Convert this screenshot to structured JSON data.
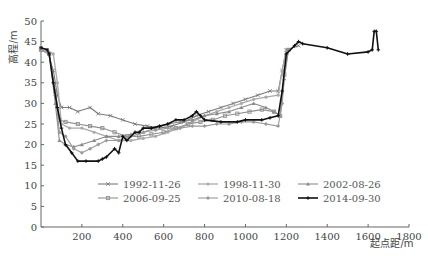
{
  "chart_data": {
    "type": "line",
    "title": "",
    "xlabel": "起点距/m",
    "ylabel": "高程/m",
    "xlim": [
      0,
      1800
    ],
    "ylim": [
      0,
      50
    ],
    "xticks": [
      200,
      400,
      600,
      800,
      1000,
      1200,
      1400,
      1600,
      1800
    ],
    "yticks": [
      0,
      5,
      10,
      15,
      20,
      25,
      30,
      35,
      40,
      45,
      50
    ],
    "grid": false,
    "legend_position": "lower center (inside plot)",
    "series": [
      {
        "name": "1992-11-26",
        "marker": "x",
        "color": "#7a7a7a",
        "width": 1.1,
        "points": [
          [
            0,
            43.5
          ],
          [
            30,
            43
          ],
          [
            60,
            38
          ],
          [
            80,
            32
          ],
          [
            100,
            29
          ],
          [
            140,
            29
          ],
          [
            180,
            28
          ],
          [
            240,
            29
          ],
          [
            280,
            27.5
          ],
          [
            340,
            27
          ],
          [
            400,
            26
          ],
          [
            460,
            25
          ],
          [
            520,
            24.5
          ],
          [
            580,
            24
          ],
          [
            640,
            24.5
          ],
          [
            700,
            25.5
          ],
          [
            760,
            27
          ],
          [
            820,
            28
          ],
          [
            880,
            29
          ],
          [
            940,
            30
          ],
          [
            1000,
            31
          ],
          [
            1060,
            32
          ],
          [
            1120,
            33
          ],
          [
            1160,
            33
          ],
          [
            1180,
            38
          ],
          [
            1200,
            43
          ],
          [
            1260,
            44
          ]
        ]
      },
      {
        "name": "1998-11-30",
        "marker": "circle",
        "color": "#aaaaaa",
        "width": 1.3,
        "points": [
          [
            0,
            43
          ],
          [
            30,
            43
          ],
          [
            60,
            42
          ],
          [
            80,
            35
          ],
          [
            100,
            25
          ],
          [
            140,
            24
          ],
          [
            200,
            24
          ],
          [
            260,
            23
          ],
          [
            320,
            22
          ],
          [
            380,
            21
          ],
          [
            440,
            21
          ],
          [
            500,
            21.5
          ],
          [
            560,
            22
          ],
          [
            620,
            23
          ],
          [
            680,
            24
          ],
          [
            740,
            25.5
          ],
          [
            800,
            27
          ],
          [
            860,
            28
          ],
          [
            920,
            29
          ],
          [
            980,
            30
          ],
          [
            1040,
            31
          ],
          [
            1100,
            31.5
          ],
          [
            1160,
            32
          ],
          [
            1180,
            38
          ],
          [
            1200,
            43
          ]
        ]
      },
      {
        "name": "2002-08-26",
        "marker": "triangle",
        "color": "#8a8a8a",
        "width": 1.1,
        "points": [
          [
            0,
            43
          ],
          [
            40,
            42
          ],
          [
            70,
            30
          ],
          [
            90,
            21
          ],
          [
            120,
            20
          ],
          [
            160,
            19.5
          ],
          [
            200,
            20
          ],
          [
            260,
            21
          ],
          [
            320,
            22
          ],
          [
            380,
            22
          ],
          [
            440,
            22.5
          ],
          [
            500,
            23
          ],
          [
            560,
            24
          ],
          [
            620,
            25
          ],
          [
            680,
            25.5
          ],
          [
            740,
            26
          ],
          [
            800,
            27
          ],
          [
            860,
            27.5
          ],
          [
            920,
            28
          ],
          [
            980,
            29
          ],
          [
            1040,
            30
          ],
          [
            1100,
            29
          ],
          [
            1140,
            28
          ],
          [
            1170,
            27
          ],
          [
            1190,
            36
          ],
          [
            1210,
            43
          ]
        ]
      },
      {
        "name": "2006-09-25",
        "marker": "square",
        "color": "#909090",
        "width": 1.1,
        "points": [
          [
            0,
            43
          ],
          [
            40,
            42
          ],
          [
            70,
            33
          ],
          [
            90,
            26
          ],
          [
            120,
            25.5
          ],
          [
            180,
            25
          ],
          [
            240,
            24.5
          ],
          [
            300,
            24
          ],
          [
            360,
            23
          ],
          [
            420,
            22
          ],
          [
            480,
            22
          ],
          [
            540,
            22.5
          ],
          [
            600,
            23
          ],
          [
            660,
            24
          ],
          [
            720,
            25
          ],
          [
            780,
            25.5
          ],
          [
            840,
            26
          ],
          [
            900,
            27
          ],
          [
            960,
            27.5
          ],
          [
            1020,
            28
          ],
          [
            1080,
            28.5
          ],
          [
            1140,
            28
          ],
          [
            1170,
            27
          ],
          [
            1190,
            37
          ],
          [
            1210,
            43
          ]
        ]
      },
      {
        "name": "2010-08-18",
        "marker": "diamond",
        "color": "#9a9a9a",
        "width": 1.1,
        "points": [
          [
            0,
            43
          ],
          [
            40,
            42
          ],
          [
            70,
            32
          ],
          [
            90,
            23
          ],
          [
            120,
            22
          ],
          [
            160,
            19
          ],
          [
            200,
            18
          ],
          [
            240,
            19
          ],
          [
            280,
            20
          ],
          [
            320,
            21
          ],
          [
            380,
            21
          ],
          [
            440,
            22
          ],
          [
            500,
            23
          ],
          [
            560,
            23.5
          ],
          [
            620,
            24
          ],
          [
            680,
            24
          ],
          [
            740,
            24.5
          ],
          [
            800,
            24.5
          ],
          [
            860,
            25
          ],
          [
            920,
            25
          ],
          [
            980,
            25.5
          ],
          [
            1040,
            25.5
          ],
          [
            1100,
            25
          ],
          [
            1160,
            24.5
          ],
          [
            1180,
            30
          ],
          [
            1200,
            42
          ]
        ]
      },
      {
        "name": "2014-09-30",
        "marker": "plus",
        "color": "#111111",
        "width": 1.6,
        "points": [
          [
            0,
            43.5
          ],
          [
            30,
            43
          ],
          [
            40,
            42
          ],
          [
            60,
            35
          ],
          [
            80,
            29
          ],
          [
            100,
            24
          ],
          [
            120,
            20
          ],
          [
            150,
            18
          ],
          [
            180,
            16
          ],
          [
            220,
            16
          ],
          [
            280,
            16
          ],
          [
            300,
            16.5
          ],
          [
            320,
            17
          ],
          [
            360,
            19
          ],
          [
            380,
            18
          ],
          [
            400,
            22
          ],
          [
            420,
            21
          ],
          [
            460,
            23
          ],
          [
            480,
            23
          ],
          [
            500,
            24
          ],
          [
            540,
            24
          ],
          [
            580,
            24.5
          ],
          [
            620,
            25
          ],
          [
            660,
            26
          ],
          [
            700,
            26
          ],
          [
            740,
            27
          ],
          [
            760,
            28
          ],
          [
            780,
            27
          ],
          [
            800,
            26
          ],
          [
            880,
            25.5
          ],
          [
            960,
            25.5
          ],
          [
            1000,
            26
          ],
          [
            1080,
            26
          ],
          [
            1120,
            26.5
          ],
          [
            1160,
            27
          ],
          [
            1180,
            33
          ],
          [
            1200,
            42
          ],
          [
            1240,
            44
          ],
          [
            1260,
            45
          ],
          [
            1280,
            44.5
          ],
          [
            1400,
            43.5
          ],
          [
            1500,
            42
          ],
          [
            1600,
            42.5
          ],
          [
            1620,
            43
          ],
          [
            1630,
            47.5
          ],
          [
            1640,
            47.5
          ],
          [
            1650,
            43
          ]
        ]
      }
    ],
    "legend": [
      {
        "label": "1992-11-26",
        "col": 0,
        "row": 0
      },
      {
        "label": "1998-11-30",
        "col": 1,
        "row": 0
      },
      {
        "label": "2002-08-26",
        "col": 2,
        "row": 0
      },
      {
        "label": "2006-09-25",
        "col": 0,
        "row": 1
      },
      {
        "label": "2010-08-18",
        "col": 1,
        "row": 1
      },
      {
        "label": "2014-09-30",
        "col": 2,
        "row": 1
      }
    ]
  }
}
